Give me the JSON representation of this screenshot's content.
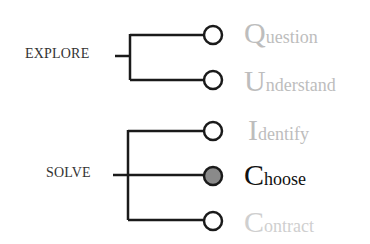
{
  "groups": [
    {
      "label": "EXPLORE"
    },
    {
      "label": "SOLVE"
    }
  ],
  "steps": [
    {
      "initial": "Q",
      "rest": "uestion",
      "state": "inactive"
    },
    {
      "initial": "U",
      "rest": "nderstand",
      "state": "inactive"
    },
    {
      "initial": "I",
      "rest": "dentify",
      "state": "inactive"
    },
    {
      "initial": "C",
      "rest": "hoose",
      "state": "active"
    },
    {
      "initial": "C",
      "rest": "ontract",
      "state": "inactive"
    }
  ],
  "colors": {
    "line": "#1a1a1a",
    "active_node_fill": "#8a8a8a",
    "inactive_text": "#bdbdbd",
    "active_text": "#111111"
  }
}
